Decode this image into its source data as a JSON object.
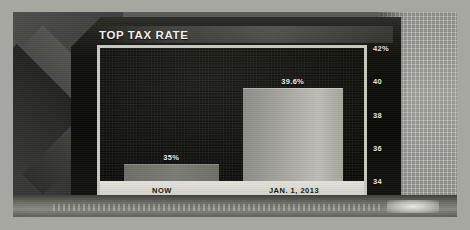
{
  "broadcast": {
    "panel_title": "TOP TAX RATE"
  },
  "chart_data": {
    "type": "bar",
    "title": "TOP TAX RATE",
    "xlabel": "",
    "ylabel": "",
    "categories": [
      "NOW",
      "JAN. 1, 2013"
    ],
    "values": [
      35,
      39.6
    ],
    "data_labels": [
      "35%",
      "39.6%"
    ],
    "ylim": [
      34,
      42
    ],
    "yticks": [
      34,
      36,
      38,
      40,
      42
    ],
    "ytick_labels": [
      "34",
      "36",
      "38",
      "40",
      "42%"
    ],
    "grid": false,
    "legend": "none",
    "axis_position": "right",
    "colors": {
      "bar_now": "#7c7c76",
      "bar_2013": "#b0b0a9",
      "panel_background": "#0d0d0a",
      "plot_border": "#c9c9c2",
      "title_text": "#f2f2ee",
      "axis_text": "#e8e8e2",
      "category_strip": "#dcdcd4"
    }
  }
}
